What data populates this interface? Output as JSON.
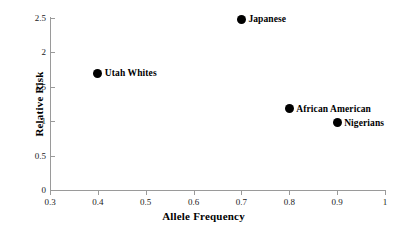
{
  "chart_data": {
    "type": "scatter",
    "title": "",
    "xlabel": "Allele Frequency",
    "ylabel": "Relative Risk",
    "xlim": [
      0.3,
      1
    ],
    "ylim": [
      0,
      2.5
    ],
    "grid": false,
    "legend": "none",
    "x_ticks": [
      "0.3",
      "0.4",
      "0.5",
      "0.6",
      "0.7",
      "0.8",
      "0.9",
      "1"
    ],
    "x_tick_values": [
      0.3,
      0.4,
      0.5,
      0.6,
      0.7,
      0.8,
      0.9,
      1
    ],
    "y_ticks": [
      "0",
      "0.5",
      "1",
      "1.5",
      "2",
      "2.5"
    ],
    "y_tick_values": [
      0,
      0.5,
      1,
      1.5,
      2,
      2.5
    ],
    "points": [
      {
        "label": "Japanese",
        "x": 0.7,
        "y": 2.48
      },
      {
        "label": "Utah Whites",
        "x": 0.4,
        "y": 1.7
      },
      {
        "label": "African American",
        "x": 0.8,
        "y": 1.18
      },
      {
        "label": "Nigerians",
        "x": 0.9,
        "y": 0.98
      }
    ],
    "marker_color": "#000000",
    "axis_color": "#9a9a9a"
  }
}
